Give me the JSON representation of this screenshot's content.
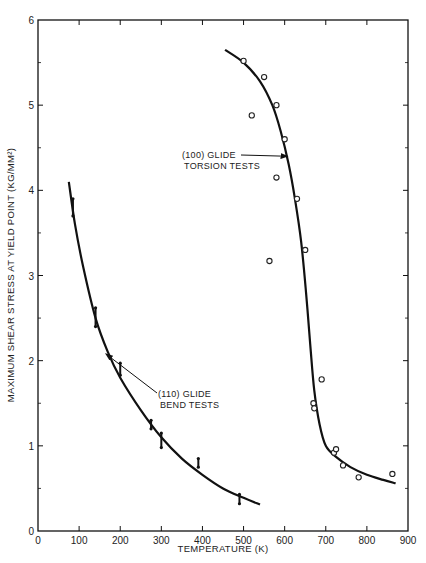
{
  "chart_data": {
    "type": "scatter",
    "title": "",
    "xlabel": "TEMPERATURE (K)",
    "ylabel": "MAXIMUM SHEAR STRESS AT YIELD POINT (KG/MM²)",
    "xlim": [
      0,
      900
    ],
    "ylim": [
      0,
      6
    ],
    "x_ticks": [
      0,
      100,
      200,
      300,
      400,
      500,
      600,
      700,
      800,
      900
    ],
    "x_tick_labels": [
      "0",
      "100",
      "200",
      "300",
      "400",
      "500",
      "600",
      "700",
      "800",
      "900"
    ],
    "y_ticks": [
      0,
      1,
      2,
      3,
      4,
      5,
      6
    ],
    "y_tick_labels": [
      "0",
      "1",
      "2",
      "3",
      "4",
      "5",
      "6"
    ],
    "grid": false,
    "legend": null,
    "series": [
      {
        "name": "(110) GLIDE BEND TESTS",
        "marker": "bar-range",
        "points": [
          {
            "x": 85,
            "y": 3.85,
            "ylow": 3.7,
            "yhigh": 3.9
          },
          {
            "x": 140,
            "y": 2.5,
            "ylow": 2.4,
            "yhigh": 2.62
          },
          {
            "x": 200,
            "y": 1.9,
            "ylow": 1.83,
            "yhigh": 1.97
          },
          {
            "x": 275,
            "y": 1.25,
            "ylow": 1.2,
            "yhigh": 1.3
          },
          {
            "x": 300,
            "y": 1.05,
            "ylow": 0.98,
            "yhigh": 1.15
          },
          {
            "x": 390,
            "y": 0.8,
            "ylow": 0.75,
            "yhigh": 0.85
          },
          {
            "x": 490,
            "y": 0.38,
            "ylow": 0.32,
            "yhigh": 0.43
          }
        ],
        "curve": [
          [
            75,
            4.1
          ],
          [
            90,
            3.6
          ],
          [
            110,
            3.1
          ],
          [
            140,
            2.5
          ],
          [
            170,
            2.1
          ],
          [
            200,
            1.8
          ],
          [
            250,
            1.42
          ],
          [
            300,
            1.1
          ],
          [
            350,
            0.85
          ],
          [
            400,
            0.66
          ],
          [
            450,
            0.5
          ],
          [
            500,
            0.39
          ],
          [
            540,
            0.31
          ]
        ]
      },
      {
        "name": "(100) GLIDE TORSION TESTS",
        "marker": "open-circle",
        "points": [
          {
            "x": 500,
            "y": 5.52
          },
          {
            "x": 520,
            "y": 4.88
          },
          {
            "x": 550,
            "y": 5.33
          },
          {
            "x": 580,
            "y": 5.0
          },
          {
            "x": 600,
            "y": 4.6
          },
          {
            "x": 580,
            "y": 4.15
          },
          {
            "x": 630,
            "y": 3.9
          },
          {
            "x": 563,
            "y": 3.17
          },
          {
            "x": 650,
            "y": 3.3
          },
          {
            "x": 690,
            "y": 1.78
          },
          {
            "x": 670,
            "y": 1.5
          },
          {
            "x": 672,
            "y": 1.44
          },
          {
            "x": 720,
            "y": 0.92
          },
          {
            "x": 725,
            "y": 0.96
          },
          {
            "x": 742,
            "y": 0.77
          },
          {
            "x": 780,
            "y": 0.63
          },
          {
            "x": 862,
            "y": 0.67
          }
        ],
        "curve": [
          [
            455,
            5.65
          ],
          [
            500,
            5.5
          ],
          [
            540,
            5.28
          ],
          [
            570,
            5.0
          ],
          [
            590,
            4.7
          ],
          [
            610,
            4.3
          ],
          [
            625,
            3.9
          ],
          [
            640,
            3.4
          ],
          [
            652,
            2.8
          ],
          [
            662,
            2.2
          ],
          [
            672,
            1.65
          ],
          [
            685,
            1.25
          ],
          [
            700,
            1.0
          ],
          [
            725,
            0.87
          ],
          [
            760,
            0.75
          ],
          [
            800,
            0.66
          ],
          [
            840,
            0.6
          ],
          [
            870,
            0.56
          ]
        ]
      }
    ],
    "annotations": [
      {
        "lines": [
          "(110) GLIDE",
          "BEND TESTS"
        ],
        "arrow_to": {
          "x": 165,
          "y": 2.08
        }
      },
      {
        "lines": [
          "(100) GLIDE",
          "TORSION TESTS"
        ],
        "arrow_to": {
          "x": 607,
          "y": 4.4
        }
      }
    ]
  }
}
